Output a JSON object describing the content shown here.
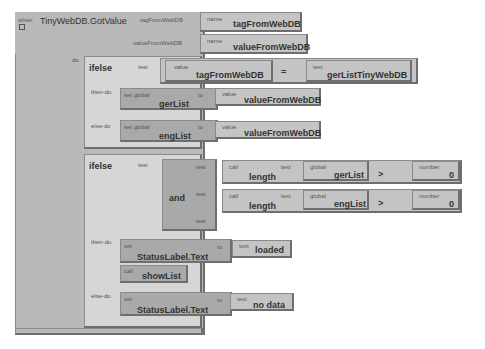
{
  "event": {
    "when_label": "when",
    "name": "TinyWebDB.GotValue",
    "params": [
      {
        "label": "tagFromWebDB",
        "name_label": "name",
        "name": "tagFromWebDB"
      },
      {
        "label": "valueFromWebDB",
        "name_label": "name",
        "name": "valueFromWebDB"
      }
    ],
    "do_label": "do"
  },
  "ifelse1": {
    "keyword": "ifelse",
    "test_label": "test",
    "compare": {
      "left_label": "value",
      "left": "tagFromWebDB",
      "op": "=",
      "right_label": "text",
      "right": "gerListTinyWebDB"
    },
    "then_label": "then-do",
    "then": {
      "set_label": "set global",
      "var": "gerList",
      "to_label": "to",
      "value_label": "value",
      "value": "valueFromWebDB"
    },
    "else_label": "else-do",
    "else": {
      "set_label": "set global",
      "var": "engList",
      "to_label": "to",
      "value_label": "value",
      "value": "valueFromWebDB"
    }
  },
  "ifelse2": {
    "keyword": "ifelse",
    "test_label": "test",
    "and_label": "and",
    "and_tests": [
      {
        "test_label": "test",
        "call_label": "call",
        "func": "length",
        "text_label": "text",
        "global_label": "global",
        "var": "gerList",
        "op": ">",
        "num_label": "number",
        "num": "0"
      },
      {
        "test_label": "test",
        "call_label": "call",
        "func": "length",
        "text_label": "text",
        "global_label": "global",
        "var": "engList",
        "op": ">",
        "num_label": "number",
        "num": "0"
      }
    ],
    "empty_test_label": "test",
    "then_label": "then-do",
    "then": [
      {
        "set_label": "set",
        "target": "StatusLabel.Text",
        "to_label": "to",
        "value_label": "text",
        "value": "loaded"
      },
      {
        "call_label": "call",
        "proc": "showList"
      }
    ],
    "else_label": "else-do",
    "else": {
      "set_label": "set",
      "target": "StatusLabel.Text",
      "to_label": "to",
      "value_label": "text",
      "value": "no data"
    }
  }
}
